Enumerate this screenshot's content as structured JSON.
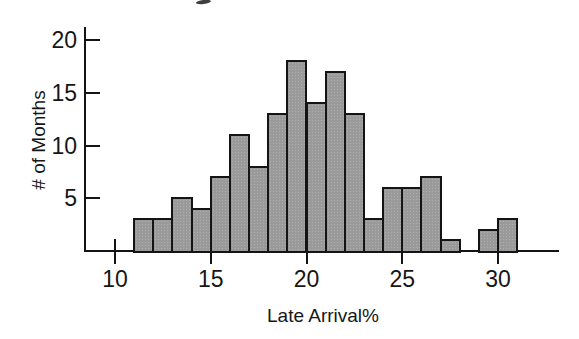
{
  "chart_data": {
    "type": "bar",
    "subtype": "histogram",
    "title": "",
    "xlabel": "Late Arrival%",
    "ylabel": "# of Months",
    "bin_width": 1,
    "bin_starts": [
      11,
      12,
      13,
      14,
      15,
      16,
      17,
      18,
      19,
      20,
      21,
      22,
      23,
      24,
      25,
      26,
      27,
      28,
      29,
      30
    ],
    "counts": [
      3,
      3,
      5,
      4,
      7,
      11,
      8,
      13,
      18,
      14,
      17,
      13,
      3,
      6,
      6,
      7,
      1,
      0,
      2,
      3
    ],
    "x_ticks": [
      10,
      15,
      20,
      25,
      30
    ],
    "y_ticks": [
      5,
      10,
      15,
      20
    ],
    "x_ticks_crossing_axis": [
      10
    ],
    "xlim": [
      8.5,
      33.2
    ],
    "ylim": [
      0,
      21
    ],
    "grid": false,
    "legend": "none",
    "colors": {
      "bar_fill": "#9a9a9a",
      "bar_border": "#141414",
      "axis": "#141414",
      "text": "#161616",
      "background": "#ffffff",
      "cropped_title_fragment": "#3f3f3f"
    }
  }
}
